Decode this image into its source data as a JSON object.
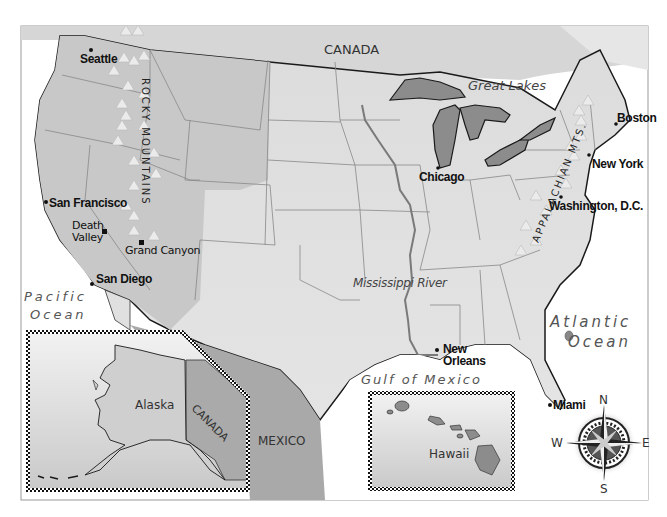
{
  "map": {
    "regions": {
      "canada_top": "CANADA",
      "canada_inset": "CANADA",
      "mexico": "MEXICO",
      "alaska": "Alaska",
      "hawaii": "Hawaii"
    },
    "water": {
      "pacific_1": "Pacific",
      "pacific_2": "Ocean",
      "atlantic_1": "Atlantic",
      "atlantic_2": "Ocean",
      "gulf": "Gulf of Mexico"
    },
    "features": {
      "great_lakes": "Great Lakes",
      "mississippi": "Mississippi River",
      "rocky": "ROCKY MOUNTAINS",
      "appalachian": "APPALACHIAN MTS."
    },
    "cities": {
      "seattle": "Seattle",
      "san_francisco": "San Francisco",
      "death_valley_1": "Death",
      "death_valley_2": "Valley",
      "grand_canyon": "Grand Canyon",
      "san_diego": "San Diego",
      "chicago": "Chicago",
      "boston": "Boston",
      "new_york": "New York",
      "washington": "Washington, D.C.",
      "new_orleans_1": "New",
      "new_orleans_2": "Orleans",
      "miami": "Miami"
    },
    "compass": {
      "n": "N",
      "s": "S",
      "e": "E",
      "w": "W"
    },
    "colors": {
      "land": "#d9d9d9",
      "west_states": "#c8c8c8",
      "lakes": "#8c8c8c",
      "water": "#ffffff",
      "border": "#1a1a1a",
      "river": "#7a7a7a",
      "mexico": "#a9a9a9"
    }
  }
}
